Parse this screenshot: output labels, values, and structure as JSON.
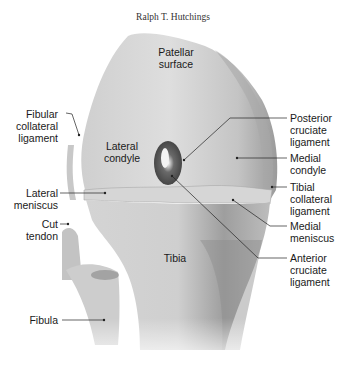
{
  "figure": {
    "credit": "Ralph T. Hutchings"
  },
  "labels": {
    "patellar_surface": "Patellar\nsurface",
    "fibular_collateral_ligament": "Fibular\ncollateral\nligament",
    "lateral_condyle": "Lateral\ncondyle",
    "lateral_meniscus": "Lateral\nmeniscus",
    "cut_tendon": "Cut\ntendon",
    "fibula": "Fibula",
    "tibia": "Tibia",
    "posterior_cruciate_ligament": "Posterior\ncruciate\nligament",
    "medial_condyle": "Medial\ncondyle",
    "tibial_collateral_ligament": "Tibial\ncollateral\nligament",
    "medial_meniscus": "Medial\nmeniscus",
    "anterior_cruciate_ligament": "Anterior\ncruciate\nligament"
  },
  "colors": {
    "bone_light": "#d9d9d9",
    "bone_mid": "#bdbdbd",
    "bone_dark": "#8c8c8c",
    "leader_line": "#222222",
    "text": "#1a1a1a"
  }
}
